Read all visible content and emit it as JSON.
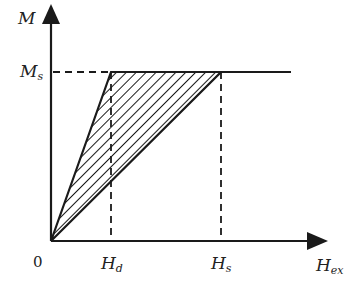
{
  "diagram": {
    "type": "magnetization curve (M vs H_ex) with hatched triangular region",
    "axes": {
      "y_label": "M",
      "x_label_main": "H",
      "x_label_sub": "ex",
      "origin_label": "0"
    },
    "levels": {
      "ms_main": "M",
      "ms_sub": "s"
    },
    "x_marks": [
      {
        "main": "H",
        "sub": "d"
      },
      {
        "main": "H",
        "sub": "s"
      }
    ],
    "colors": {
      "line": "#1a1a1a",
      "background": "#ffffff"
    }
  }
}
